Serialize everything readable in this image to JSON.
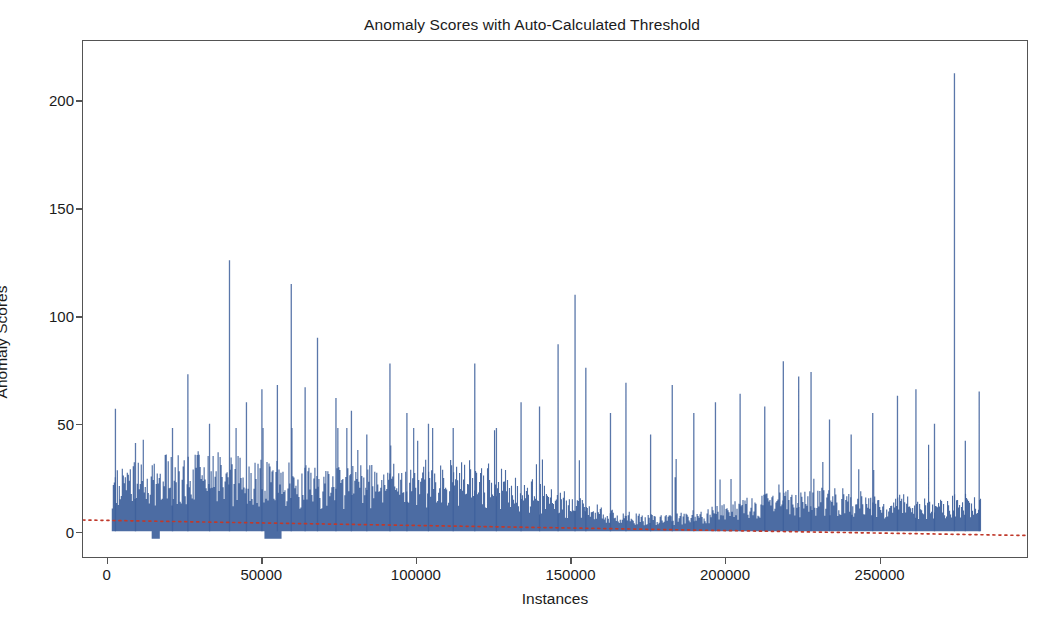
{
  "chart_data": {
    "type": "line",
    "title": "Anomaly Scores with Auto-Calculated Threshold",
    "xlabel": "Instances",
    "ylabel": "Anomaly Scores",
    "xlim": [
      -8000,
      298000
    ],
    "ylim": [
      -12,
      228
    ],
    "grid": false,
    "legend": null,
    "xticks": [
      0,
      50000,
      100000,
      150000,
      200000,
      250000
    ],
    "xtick_labels": [
      "0",
      "50000",
      "100000",
      "150000",
      "200000",
      "250000"
    ],
    "yticks": [
      0,
      50,
      100,
      150,
      200
    ],
    "ytick_labels": [
      "0",
      "50",
      "100",
      "150",
      "200"
    ],
    "series": [
      {
        "name": "Anomaly Scores",
        "type": "line",
        "color": "#3d5f9b",
        "x_range": [
          1500,
          283000
        ],
        "n_points": 283000,
        "y_min": 0,
        "y_max": 213,
        "baseline_dense_band": [
          0,
          28
        ],
        "notable_peaks": [
          {
            "x": 2500,
            "y": 57
          },
          {
            "x": 9000,
            "y": 41
          },
          {
            "x": 21000,
            "y": 48
          },
          {
            "x": 26000,
            "y": 73
          },
          {
            "x": 33000,
            "y": 50
          },
          {
            "x": 39500,
            "y": 126
          },
          {
            "x": 45000,
            "y": 60
          },
          {
            "x": 50000,
            "y": 66
          },
          {
            "x": 55000,
            "y": 68
          },
          {
            "x": 59500,
            "y": 115
          },
          {
            "x": 64000,
            "y": 67
          },
          {
            "x": 68000,
            "y": 90
          },
          {
            "x": 74000,
            "y": 62
          },
          {
            "x": 79000,
            "y": 56
          },
          {
            "x": 84000,
            "y": 45
          },
          {
            "x": 91500,
            "y": 78
          },
          {
            "x": 97000,
            "y": 55
          },
          {
            "x": 104000,
            "y": 50
          },
          {
            "x": 112000,
            "y": 48
          },
          {
            "x": 119000,
            "y": 78
          },
          {
            "x": 126000,
            "y": 48
          },
          {
            "x": 134000,
            "y": 60
          },
          {
            "x": 140000,
            "y": 58
          },
          {
            "x": 146000,
            "y": 87
          },
          {
            "x": 151500,
            "y": 110
          },
          {
            "x": 155000,
            "y": 76
          },
          {
            "x": 163000,
            "y": 55
          },
          {
            "x": 168000,
            "y": 69
          },
          {
            "x": 176000,
            "y": 45
          },
          {
            "x": 183000,
            "y": 68
          },
          {
            "x": 190000,
            "y": 55
          },
          {
            "x": 197000,
            "y": 60
          },
          {
            "x": 205000,
            "y": 64
          },
          {
            "x": 213000,
            "y": 58
          },
          {
            "x": 219000,
            "y": 79
          },
          {
            "x": 224000,
            "y": 72
          },
          {
            "x": 228000,
            "y": 74
          },
          {
            "x": 234000,
            "y": 52
          },
          {
            "x": 241000,
            "y": 45
          },
          {
            "x": 248000,
            "y": 55
          },
          {
            "x": 256000,
            "y": 63
          },
          {
            "x": 262000,
            "y": 66
          },
          {
            "x": 268000,
            "y": 50
          },
          {
            "x": 274500,
            "y": 213
          },
          {
            "x": 278000,
            "y": 42
          },
          {
            "x": 282500,
            "y": 65
          }
        ]
      },
      {
        "name": "Auto-Calculated Threshold",
        "type": "line",
        "style": "dotted",
        "color": "#c0392b",
        "x_range": [
          -8000,
          298000
        ],
        "y_start": 5.2,
        "y_end": -2.0
      }
    ]
  }
}
